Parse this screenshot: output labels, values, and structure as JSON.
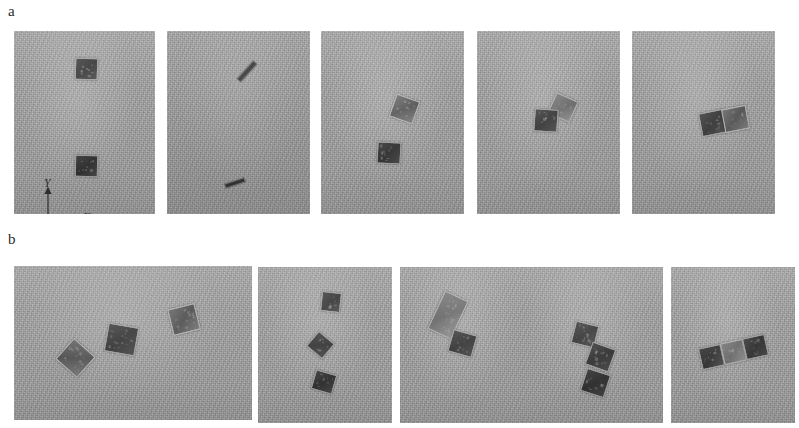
{
  "figure": {
    "background_color": "#ffffff",
    "width": 799,
    "height": 428,
    "panel_background_color": "#a6a6a6",
    "object_dark_color": "#333333",
    "object_light_color": "#6e6e6e",
    "object_border_color": "#9b9b9b"
  },
  "rows": [
    {
      "label": "a",
      "label_x": 8,
      "label_y": 4,
      "panels": [
        {
          "name": "panel-a-1",
          "x": 14,
          "y": 31,
          "w": 141,
          "h": 183,
          "dim": false,
          "objects": [
            {
              "type": "square",
              "shade": "dark",
              "cx": 72,
              "cy": 38,
              "w": 23,
              "h": 22,
              "rot": 2
            },
            {
              "type": "square",
              "shade": "dark",
              "cx": 72,
              "cy": 135,
              "w": 23,
              "h": 22,
              "rot": 1
            }
          ]
        },
        {
          "name": "panel-a-2",
          "x": 167,
          "y": 31,
          "w": 143,
          "h": 183,
          "dim": true,
          "objects": [
            {
              "type": "bar",
              "shade": "dark",
              "cx": 80,
              "cy": 40,
              "w": 26,
              "h": 7,
              "rot": -48
            },
            {
              "type": "bar",
              "shade": "dark",
              "cx": 68,
              "cy": 152,
              "w": 22,
              "h": 6,
              "rot": -18
            }
          ]
        },
        {
          "name": "panel-a-3",
          "x": 321,
          "y": 31,
          "w": 143,
          "h": 183,
          "dim": false,
          "objects": [
            {
              "type": "square",
              "shade": "mid",
              "cx": 83,
              "cy": 78,
              "w": 25,
              "h": 24,
              "rot": 20
            },
            {
              "type": "square",
              "shade": "dark",
              "cx": 68,
              "cy": 122,
              "w": 24,
              "h": 22,
              "rot": 3
            }
          ]
        },
        {
          "name": "panel-a-4",
          "x": 477,
          "y": 31,
          "w": 143,
          "h": 183,
          "dim": false,
          "objects": [
            {
              "type": "square",
              "shade": "light",
              "cx": 86,
              "cy": 76,
              "w": 24,
              "h": 23,
              "rot": 24
            },
            {
              "type": "square",
              "shade": "dark",
              "cx": 69,
              "cy": 89,
              "w": 24,
              "h": 23,
              "rot": 4
            }
          ]
        },
        {
          "name": "panel-a-5",
          "x": 632,
          "y": 31,
          "w": 143,
          "h": 183,
          "dim": false,
          "objects": [
            {
              "type": "square",
              "shade": "dark",
              "cx": 80,
              "cy": 92,
              "w": 25,
              "h": 24,
              "rot": -11
            },
            {
              "type": "square",
              "shade": "mid",
              "cx": 103,
              "cy": 88,
              "w": 25,
              "h": 24,
              "rot": -11
            }
          ]
        }
      ]
    },
    {
      "label": "b",
      "label_x": 8,
      "label_y": 232,
      "panels": [
        {
          "name": "panel-b-1",
          "x": 14,
          "y": 266,
          "w": 238,
          "h": 154,
          "dim": false,
          "objects": [
            {
              "type": "square",
              "shade": "mid",
              "cx": 61,
              "cy": 92,
              "w": 29,
              "h": 28,
              "rot": 42
            },
            {
              "type": "square",
              "shade": "dark",
              "cx": 107,
              "cy": 73,
              "w": 31,
              "h": 29,
              "rot": 10
            },
            {
              "type": "square",
              "shade": "mid",
              "cx": 170,
              "cy": 53,
              "w": 28,
              "h": 27,
              "rot": -14
            }
          ]
        },
        {
          "name": "panel-b-2",
          "x": 258,
          "y": 267,
          "w": 134,
          "h": 156,
          "dim": false,
          "objects": [
            {
              "type": "square",
              "shade": "dark",
              "cx": 73,
              "cy": 35,
              "w": 20,
              "h": 20,
              "rot": 6
            },
            {
              "type": "square",
              "shade": "dark",
              "cx": 62,
              "cy": 78,
              "w": 21,
              "h": 20,
              "rot": 40
            },
            {
              "type": "square",
              "shade": "dark",
              "cx": 66,
              "cy": 115,
              "w": 22,
              "h": 20,
              "rot": 16
            }
          ]
        },
        {
          "name": "panel-b-3",
          "x": 400,
          "y": 267,
          "w": 132,
          "h": 156,
          "dim": false,
          "objects": [
            {
              "type": "square",
              "shade": "light",
              "cx": 48,
              "cy": 48,
              "w": 26,
              "h": 42,
              "rot": 25
            },
            {
              "type": "square",
              "shade": "dark",
              "cx": 62,
              "cy": 76,
              "w": 25,
              "h": 23,
              "rot": 16
            }
          ]
        },
        {
          "name": "panel-b-4",
          "x": 523,
          "y": 267,
          "w": 140,
          "h": 156,
          "dim": false,
          "objects": [
            {
              "type": "square",
              "shade": "dark",
              "cx": 62,
              "cy": 67,
              "w": 24,
              "h": 23,
              "rot": 14
            },
            {
              "type": "square",
              "shade": "dark",
              "cx": 77,
              "cy": 90,
              "w": 25,
              "h": 24,
              "rot": 20
            },
            {
              "type": "square",
              "shade": "dark",
              "cx": 72,
              "cy": 116,
              "w": 25,
              "h": 24,
              "rot": 18
            }
          ]
        },
        {
          "name": "panel-b-5",
          "x": 671,
          "y": 267,
          "w": 124,
          "h": 156,
          "dim": false,
          "objects": [
            {
              "type": "square",
              "shade": "dark",
              "cx": 40,
              "cy": 90,
              "w": 23,
              "h": 22,
              "rot": -13
            },
            {
              "type": "square",
              "shade": "light",
              "cx": 62,
              "cy": 85,
              "w": 23,
              "h": 22,
              "rot": -13
            },
            {
              "type": "square",
              "shade": "dark",
              "cx": 84,
              "cy": 80,
              "w": 23,
              "h": 22,
              "rot": -13
            }
          ]
        }
      ]
    }
  ],
  "axes": {
    "name": "coordinate-axes",
    "panel": "panel-a-1",
    "x": 22,
    "y": 148,
    "origin_label": "O",
    "x_label": "X",
    "y_label": "Y",
    "z_label": "Z"
  }
}
